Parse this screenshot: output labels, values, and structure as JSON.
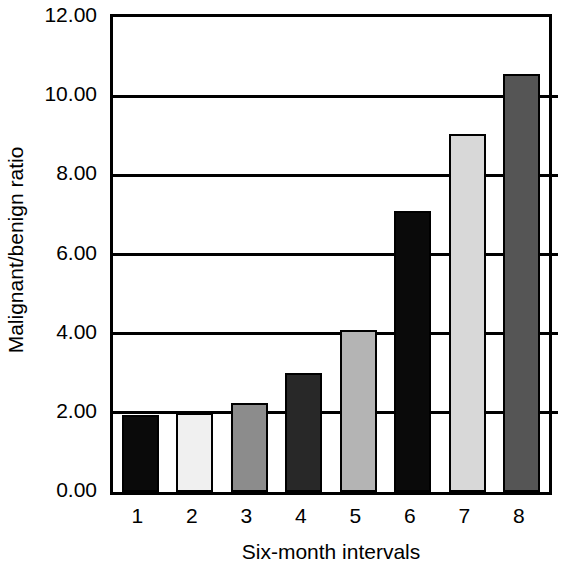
{
  "chart_data": {
    "type": "bar",
    "title": "",
    "subtitle": "",
    "xlabel": "Six-month intervals",
    "ylabel": "Malignant/benign ratio",
    "categories": [
      "1",
      "2",
      "3",
      "4",
      "5",
      "6",
      "7",
      "8"
    ],
    "values": [
      1.95,
      2.0,
      2.25,
      3.0,
      4.1,
      7.1,
      9.05,
      10.55
    ],
    "series": [
      {
        "name": "Malignant/benign ratio",
        "values": [
          1.95,
          2.0,
          2.25,
          3.0,
          4.1,
          7.1,
          9.05,
          10.55
        ]
      }
    ],
    "bar_colors": [
      "#0a0a0a",
      "#f0f0f0",
      "#8c8c8c",
      "#282828",
      "#b4b4b4",
      "#0a0a0a",
      "#d8d8d8",
      "#555555"
    ],
    "bar_border_color": "#000000",
    "ylim": [
      0.0,
      12.0
    ],
    "ytick_values": [
      0.0,
      2.0,
      4.0,
      6.0,
      8.0,
      10.0,
      12.0
    ],
    "ytick_labels": [
      "0.00",
      "2.00",
      "4.00",
      "6.00",
      "8.00",
      "10.00",
      "12.00"
    ],
    "xtick_labels": [
      "1",
      "2",
      "3",
      "4",
      "5",
      "6",
      "7",
      "8"
    ],
    "grid": true,
    "grid_axis": "y",
    "legend": false,
    "legend_position": "none",
    "background_color": "#ffffff",
    "axis_color": "#000000"
  }
}
